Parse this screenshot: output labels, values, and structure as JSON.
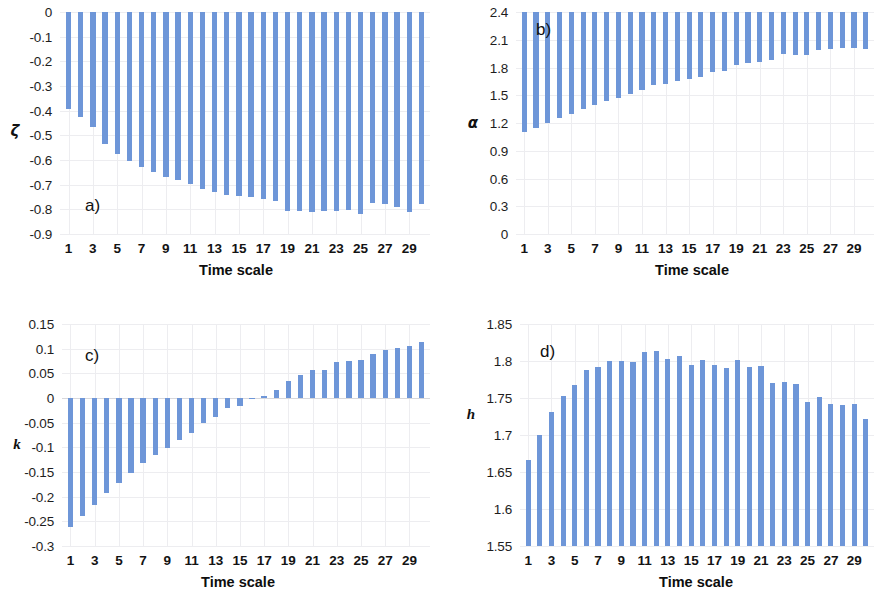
{
  "figure": {
    "background_color": "#ffffff",
    "bar_color": "#6e96d8",
    "grid_color": "#ededf0",
    "panel_count": 4
  },
  "chart_data": [
    {
      "type": "bar",
      "panel": "a)",
      "title": "",
      "xlabel": "Time scale",
      "ylabel": "ζ",
      "ylim": [
        -0.9,
        0
      ],
      "yticks": [
        0,
        -0.1,
        -0.2,
        -0.3,
        -0.4,
        -0.5,
        -0.6,
        -0.7,
        -0.8,
        -0.9
      ],
      "ytick_labels": [
        "0",
        "-0.1",
        "-0.2",
        "-0.3",
        "-0.4",
        "-0.5",
        "-0.6",
        "-0.7",
        "-0.8",
        "-0.9"
      ],
      "xticks": [
        1,
        3,
        5,
        7,
        9,
        11,
        13,
        15,
        17,
        19,
        21,
        23,
        25,
        27,
        29
      ],
      "xtick_labels": [
        "1",
        "3",
        "5",
        "7",
        "9",
        "11",
        "13",
        "15",
        "17",
        "19",
        "21",
        "23",
        "25",
        "27",
        "29"
      ],
      "xlim": [
        0.3,
        30.7
      ],
      "grid": true,
      "legend": "none",
      "categories": [
        1,
        2,
        3,
        4,
        5,
        6,
        7,
        8,
        9,
        10,
        11,
        12,
        13,
        14,
        15,
        16,
        17,
        18,
        19,
        20,
        21,
        22,
        23,
        24,
        25,
        26,
        27,
        28,
        29,
        30
      ],
      "values": [
        -0.395,
        -0.425,
        -0.465,
        -0.535,
        -0.575,
        -0.605,
        -0.63,
        -0.65,
        -0.668,
        -0.683,
        -0.697,
        -0.718,
        -0.728,
        -0.74,
        -0.745,
        -0.752,
        -0.76,
        -0.765,
        -0.805,
        -0.808,
        -0.81,
        -0.808,
        -0.805,
        -0.802,
        -0.818,
        -0.775,
        -0.778,
        -0.79,
        -0.812,
        -0.778
      ]
    },
    {
      "type": "bar",
      "panel": "b)",
      "title": "",
      "xlabel": "Time scale",
      "ylabel": "α",
      "ylim": [
        0,
        2.4
      ],
      "yticks": [
        2.4,
        2.1,
        1.8,
        1.5,
        1.2,
        0.9,
        0.6,
        0.3,
        0
      ],
      "ytick_labels": [
        "2.4",
        "2.1",
        "1.8",
        "1.5",
        "1.2",
        "0.9",
        "0.6",
        "0.3",
        "0"
      ],
      "xticks": [
        1,
        3,
        5,
        7,
        9,
        11,
        13,
        15,
        17,
        19,
        21,
        23,
        25,
        27,
        29
      ],
      "xtick_labels": [
        "1",
        "3",
        "5",
        "7",
        "9",
        "11",
        "13",
        "15",
        "17",
        "19",
        "21",
        "23",
        "25",
        "27",
        "29"
      ],
      "xlim": [
        0.3,
        30.7
      ],
      "grid": true,
      "legend": "none",
      "categories": [
        1,
        2,
        3,
        4,
        5,
        6,
        7,
        8,
        9,
        10,
        11,
        12,
        13,
        14,
        15,
        16,
        17,
        18,
        19,
        20,
        21,
        22,
        23,
        24,
        25,
        26,
        27,
        28,
        29,
        30
      ],
      "values": [
        1.1,
        1.15,
        1.2,
        1.25,
        1.3,
        1.35,
        1.39,
        1.44,
        1.47,
        1.51,
        1.56,
        1.61,
        1.62,
        1.65,
        1.68,
        1.7,
        1.75,
        1.76,
        1.83,
        1.85,
        1.86,
        1.88,
        1.95,
        1.93,
        1.93,
        1.99,
        2.0,
        2.01,
        2.01,
        2.0
      ]
    },
    {
      "type": "bar",
      "panel": "c)",
      "title": "",
      "xlabel": "Time scale",
      "ylabel": "k",
      "ylim": [
        -0.3,
        0.15
      ],
      "yticks": [
        0.15,
        0.1,
        0.05,
        0,
        -0.05,
        -0.1,
        -0.15,
        -0.2,
        -0.25,
        -0.3
      ],
      "ytick_labels": [
        "0.15",
        "0.1",
        "0.05",
        "0",
        "-0.05",
        "-0.1",
        "-0.15",
        "-0.2",
        "-0.25",
        "-0.3"
      ],
      "xticks": [
        1,
        3,
        5,
        7,
        9,
        11,
        13,
        15,
        17,
        19,
        21,
        23,
        25,
        27,
        29
      ],
      "xtick_labels": [
        "1",
        "3",
        "5",
        "7",
        "9",
        "11",
        "13",
        "15",
        "17",
        "19",
        "21",
        "23",
        "25",
        "27",
        "29"
      ],
      "xlim": [
        0.3,
        30.7
      ],
      "grid": true,
      "legend": "none",
      "categories": [
        1,
        2,
        3,
        4,
        5,
        6,
        7,
        8,
        9,
        10,
        11,
        12,
        13,
        14,
        15,
        16,
        17,
        18,
        19,
        20,
        21,
        22,
        23,
        24,
        25,
        26,
        27,
        28,
        29,
        30
      ],
      "values": [
        -0.262,
        -0.24,
        -0.217,
        -0.193,
        -0.173,
        -0.153,
        -0.131,
        -0.115,
        -0.101,
        -0.086,
        -0.07,
        -0.05,
        -0.038,
        -0.021,
        -0.016,
        -0.001,
        0.004,
        0.016,
        0.035,
        0.046,
        0.056,
        0.057,
        0.073,
        0.074,
        0.077,
        0.09,
        0.098,
        0.102,
        0.105,
        0.114
      ]
    },
    {
      "type": "bar",
      "panel": "d)",
      "title": "",
      "xlabel": "Time scale",
      "ylabel": "h",
      "ylim": [
        1.55,
        1.85
      ],
      "yticks": [
        1.85,
        1.8,
        1.75,
        1.7,
        1.65,
        1.6,
        1.55
      ],
      "ytick_labels": [
        "1.85",
        "1.8",
        "1.75",
        "1.7",
        "1.65",
        "1.6",
        "1.55"
      ],
      "xticks": [
        1,
        3,
        5,
        7,
        9,
        11,
        13,
        15,
        17,
        19,
        21,
        23,
        25,
        27,
        29
      ],
      "xtick_labels": [
        "1",
        "3",
        "5",
        "7",
        "9",
        "11",
        "13",
        "15",
        "17",
        "19",
        "21",
        "23",
        "25",
        "27",
        "29"
      ],
      "xlim": [
        0.3,
        30.7
      ],
      "grid": true,
      "legend": "none",
      "categories": [
        1,
        2,
        3,
        4,
        5,
        6,
        7,
        8,
        9,
        10,
        11,
        12,
        13,
        14,
        15,
        16,
        17,
        18,
        19,
        20,
        21,
        22,
        23,
        24,
        25,
        26,
        27,
        28,
        29,
        30
      ],
      "values": [
        1.666,
        1.7,
        1.731,
        1.753,
        1.768,
        1.788,
        1.792,
        1.8,
        1.8,
        1.798,
        1.812,
        1.813,
        1.803,
        1.807,
        1.795,
        1.802,
        1.794,
        1.791,
        1.802,
        1.792,
        1.793,
        1.77,
        1.772,
        1.769,
        1.744,
        1.752,
        1.742,
        1.741,
        1.742,
        1.722
      ]
    }
  ]
}
